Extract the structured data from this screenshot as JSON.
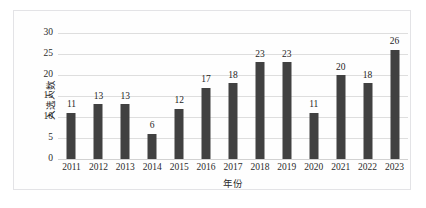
{
  "chart_data": {
    "type": "bar",
    "title": "",
    "xlabel": "年份",
    "ylabel": "入选人数",
    "categories": [
      "2011",
      "2012",
      "2013",
      "2014",
      "2015",
      "2016",
      "2017",
      "2018",
      "2019",
      "2020",
      "2021",
      "2022",
      "2023"
    ],
    "values": [
      11,
      13,
      13,
      6,
      12,
      17,
      18,
      23,
      23,
      11,
      20,
      18,
      26
    ],
    "ylim": [
      0,
      30
    ],
    "yticks": [
      0,
      5,
      10,
      15,
      20,
      25,
      30
    ],
    "grid": true,
    "legend": false,
    "bar_color": "#414141",
    "gridline_color": "#dedede",
    "background_color": "#fefefe",
    "border_color": "#e3e3e6",
    "data_labels_shown": true
  },
  "caption": {
    "text": ""
  }
}
